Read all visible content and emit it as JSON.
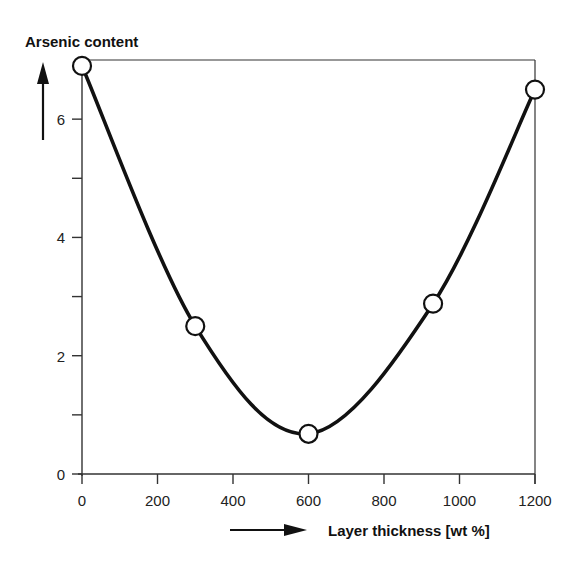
{
  "chart_data": {
    "type": "line",
    "title": "",
    "xlabel": "Layer thickness [wt %]",
    "ylabel": "Arsenic content",
    "x": [
      0,
      300,
      600,
      930,
      1200
    ],
    "series": [
      {
        "name": "Arsenic content",
        "values": [
          6.9,
          2.5,
          0.68,
          2.88,
          6.5
        ]
      }
    ],
    "xlim": [
      0,
      1200
    ],
    "ylim": [
      0,
      7
    ],
    "xticks": [
      0,
      200,
      400,
      600,
      800,
      1000,
      1200
    ],
    "xtick_labels": [
      "0",
      "200",
      "400",
      "600",
      "800",
      "1000",
      "1200"
    ],
    "yticks": [
      0,
      1,
      2,
      3,
      4,
      5,
      6
    ],
    "ytick_labels": [
      "0",
      "",
      "2",
      "",
      "4",
      "",
      "6"
    ],
    "grid": false,
    "legend": null,
    "markers": "open-circle",
    "curve": "smooth",
    "colors": {
      "line": "#111111",
      "marker_fill": "#ffffff",
      "axis": "#333333"
    }
  }
}
